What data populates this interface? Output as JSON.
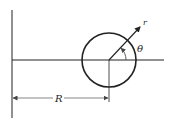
{
  "diagram": {
    "labels": {
      "radius_R": "R",
      "radial_r": "r",
      "angle_theta": "θ"
    },
    "colors": {
      "stroke": "#222222",
      "background": "#ffffff"
    }
  }
}
